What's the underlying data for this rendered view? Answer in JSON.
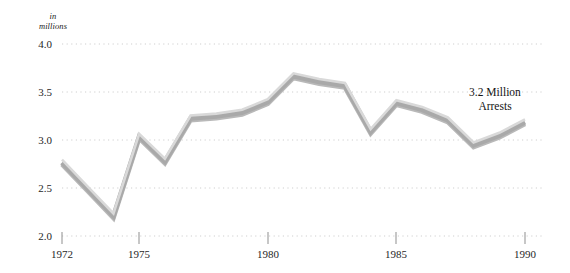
{
  "chart_data": {
    "type": "line",
    "title": "",
    "subtitle": "",
    "xlabel": "",
    "ylabel": "in millions",
    "unit_caption_line1": "in",
    "unit_caption_line2": "millions",
    "xlim": [
      1972,
      1990
    ],
    "ylim": [
      2.0,
      4.0
    ],
    "grid": true,
    "grid_style": "dotted-horizontal",
    "legend": "none",
    "x": [
      1972,
      1973,
      1974,
      1975,
      1976,
      1977,
      1978,
      1979,
      1980,
      1981,
      1982,
      1983,
      1984,
      1985,
      1986,
      1987,
      1988,
      1989,
      1990
    ],
    "values": [
      2.78,
      2.5,
      2.22,
      3.05,
      2.79,
      3.24,
      3.26,
      3.3,
      3.41,
      3.68,
      3.62,
      3.58,
      3.1,
      3.4,
      3.33,
      3.22,
      2.96,
      3.06,
      3.2
    ],
    "series": [
      {
        "name": "Arrests",
        "values": [
          2.78,
          2.5,
          2.22,
          3.05,
          2.79,
          3.24,
          3.26,
          3.3,
          3.41,
          3.68,
          3.62,
          3.58,
          3.1,
          3.4,
          3.33,
          3.22,
          2.96,
          3.06,
          3.2
        ]
      }
    ],
    "y_ticks": [
      "4.0",
      "3.5",
      "3.0",
      "2.5",
      "2.0"
    ],
    "y_tick_values": [
      4.0,
      3.5,
      3.0,
      2.5,
      2.0
    ],
    "x_ticks": [
      "1972",
      "1975",
      "1980",
      "1985",
      "1990"
    ],
    "x_tick_values": [
      1972,
      1975,
      1980,
      1985,
      1990
    ],
    "annotations": [
      {
        "line1": "3.2 Million",
        "line2": "Arrests",
        "at_x": 1990,
        "at_y": 3.2
      }
    ],
    "colors": {
      "line_top_highlight": "#d7d7d7",
      "line_body": "#a9a9a9",
      "line_shadow": "#bdbdbd",
      "gridline": "#cfcfcf",
      "tick_mark": "#8a8a8a",
      "text": "#1a1a1a",
      "background": "#ffffff"
    }
  }
}
